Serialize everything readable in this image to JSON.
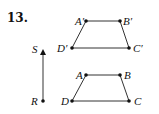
{
  "problem_number": "13.",
  "colors": {
    "ink": "#111111",
    "line": "#333333",
    "vector": "#555555"
  },
  "vector": {
    "start_label": "R",
    "end_label": "S",
    "start": [
      43,
      101
    ],
    "end": [
      43,
      50
    ]
  },
  "preimage": {
    "labels": {
      "A": "A",
      "B": "B",
      "C": "C",
      "D": "D"
    },
    "points": {
      "A": [
        86,
        75
      ],
      "B": [
        120,
        75
      ],
      "C": [
        129,
        101
      ],
      "D": [
        72,
        101
      ]
    }
  },
  "image": {
    "labels": {
      "A": "A′",
      "B": "B′",
      "C": "C′",
      "D": "D′"
    },
    "points": {
      "A": [
        86,
        21
      ],
      "B": [
        120,
        21
      ],
      "C": [
        129,
        48
      ],
      "D": [
        72,
        48
      ]
    }
  }
}
